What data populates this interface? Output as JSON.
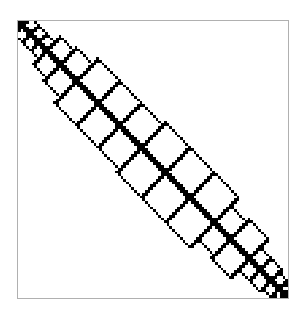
{
  "chart_data": {
    "type": "heatmap",
    "subtype": "sparsity-pattern",
    "title": "",
    "xlabel": "",
    "ylabel": "",
    "grid": false,
    "legend": null,
    "matrix_size": 100,
    "diagonal_halfwidth": 1,
    "block_boundaries": [
      0,
      1,
      4,
      7,
      10,
      15,
      21,
      29,
      37,
      45,
      54,
      63,
      72,
      78,
      85,
      89,
      93,
      96,
      98,
      100
    ],
    "colors": {
      "nonzero": "#000000",
      "background": "#ffffff",
      "frame": "#b0b0b0"
    }
  }
}
